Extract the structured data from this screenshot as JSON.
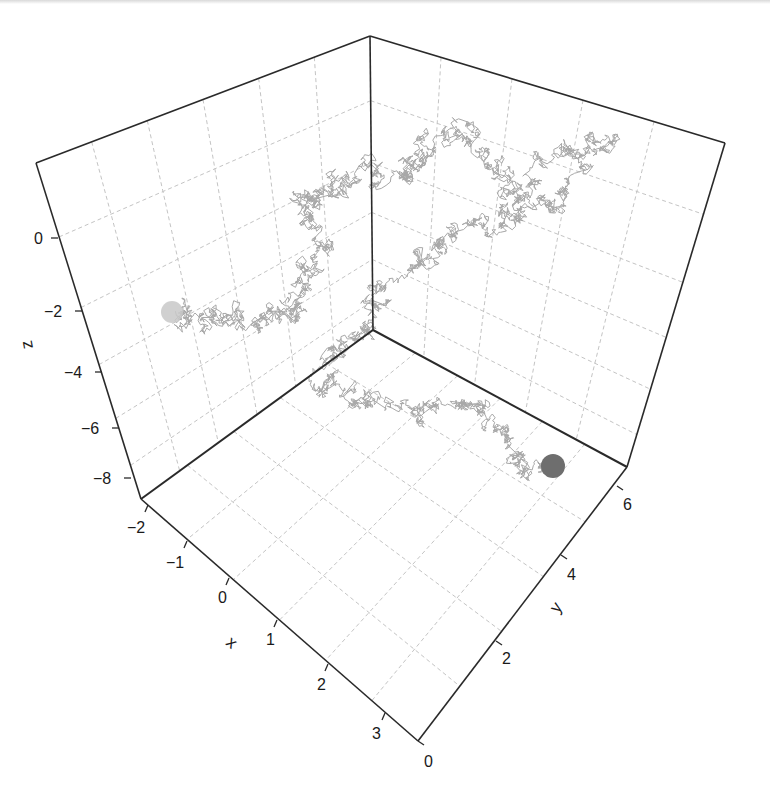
{
  "chart_data": {
    "type": "line3d",
    "title": "",
    "axes": {
      "x": {
        "label": "x",
        "ticks": [
          "-2",
          "-1",
          "0",
          "1",
          "2",
          "3"
        ],
        "range": [
          -2.2,
          3.6
        ]
      },
      "y": {
        "label": "y",
        "ticks": [
          "0",
          "2",
          "4",
          "6"
        ],
        "range": [
          0,
          6.5
        ]
      },
      "z": {
        "label": "z",
        "ticks": [
          "0",
          "-2",
          "-4",
          "-6",
          "-8"
        ],
        "range": [
          -8.7,
          1.8
        ]
      }
    },
    "grid": true,
    "series": [
      {
        "name": "trajectory",
        "color": "#a8a8a8",
        "waypoints_2d": [
          [
            174,
            313
          ],
          [
            210,
            318
          ],
          [
            240,
            322
          ],
          [
            290,
            318
          ],
          [
            300,
            290
          ],
          [
            320,
            250
          ],
          [
            300,
            200
          ],
          [
            330,
            190
          ],
          [
            360,
            170
          ],
          [
            400,
            175
          ],
          [
            420,
            150
          ],
          [
            470,
            125
          ],
          [
            500,
            170
          ],
          [
            520,
            210
          ],
          [
            560,
            150
          ],
          [
            610,
            145
          ],
          [
            560,
            200
          ],
          [
            510,
            215
          ],
          [
            460,
            230
          ],
          [
            420,
            260
          ],
          [
            380,
            300
          ],
          [
            350,
            340
          ],
          [
            320,
            380
          ],
          [
            360,
            400
          ],
          [
            420,
            420
          ],
          [
            460,
            405
          ],
          [
            500,
            430
          ],
          [
            520,
            460
          ],
          [
            548,
            475
          ]
        ]
      }
    ],
    "markers": [
      {
        "name": "start",
        "color": "#c8c8c8",
        "screen": [
          172,
          312
        ],
        "r": 11
      },
      {
        "name": "end",
        "color": "#6e6e6e",
        "screen": [
          553,
          466
        ],
        "r": 12
      }
    ]
  },
  "style": {
    "axis_color": "#2a2a2a",
    "grid_color": "#c4c4c4",
    "trace_color": "#a8a8a8"
  }
}
